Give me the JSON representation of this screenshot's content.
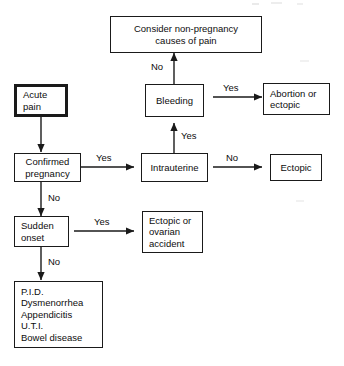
{
  "diagram": {
    "colors": {
      "ink": "#0d0d0d",
      "line": "#1a1a1a",
      "paper": "#ffffff"
    },
    "nodes": {
      "consider_non_pregnancy": {
        "line1": "Consider non-pregnancy",
        "line2": "causes of pain"
      },
      "acute_pain": {
        "line1": "Acute",
        "line2": "pain"
      },
      "bleeding": {
        "line1": "Bleeding"
      },
      "abortion_or_ectopic": {
        "line1": "Abortion or",
        "line2": "ectopic"
      },
      "confirmed_pregnancy": {
        "line1": "Confirmed",
        "line2": "pregnancy"
      },
      "intrauterine": {
        "line1": "Intrauterine"
      },
      "ectopic": {
        "line1": "Ectopic"
      },
      "sudden_onset": {
        "line1": "Sudden",
        "line2": "onset"
      },
      "ectopic_or_ovarian_accident": {
        "line1": "Ectopic or",
        "line2": "ovarian",
        "line3": "accident"
      },
      "differential_list": {
        "line1": "P.I.D.",
        "line2": "Dysmenorrhea",
        "line3": "Appendicitis",
        "line4": "U.T.I.",
        "line5": "Bowel disease"
      }
    },
    "edge_labels": {
      "bleeding_no": "No",
      "bleeding_yes": "Yes",
      "intrauterine_yes": "Yes",
      "intrauterine_no": "No",
      "confirmed_pregnancy_yes": "Yes",
      "confirmed_pregnancy_no": "No",
      "sudden_onset_yes": "Yes",
      "sudden_onset_no": "No"
    }
  }
}
